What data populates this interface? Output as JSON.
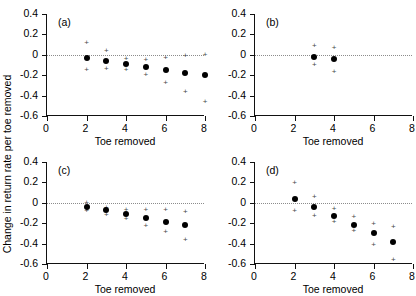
{
  "figure": {
    "ylabel": "Change in return rate per toe removed",
    "xlabel": "Toe removed"
  },
  "axis": {
    "yticks": [
      "0.4",
      "0.2",
      "0",
      "-0.2",
      "-0.4",
      "-0.6"
    ],
    "ytick_values": [
      0.4,
      0.2,
      0,
      -0.2,
      -0.4,
      -0.6
    ],
    "xticks": [
      "0",
      "2",
      "4",
      "6",
      "8"
    ],
    "xtick_values": [
      0,
      2,
      4,
      6,
      8
    ],
    "ylim": [
      -0.6,
      0.4
    ],
    "xlim": [
      0,
      8
    ]
  },
  "panels": [
    {
      "tag": "(a)"
    },
    {
      "tag": "(b)"
    },
    {
      "tag": "(c)"
    },
    {
      "tag": "(d)"
    }
  ],
  "chart_data": [
    {
      "type": "scatter",
      "panel": "(a)",
      "title": "",
      "xlabel": "Toe removed",
      "ylabel": "Change in return rate per toe removed",
      "xlim": [
        0,
        8
      ],
      "ylim": [
        -0.6,
        0.4
      ],
      "grid": false,
      "legend": "none",
      "annotations": [
        "dotted horizontal reference line at y = 0"
      ],
      "x": [
        2,
        3,
        4,
        5,
        6,
        7,
        8
      ],
      "values": [
        -0.035,
        -0.065,
        -0.09,
        -0.12,
        -0.145,
        -0.175,
        -0.2
      ],
      "upper": [
        0.125,
        0.045,
        -0.03,
        -0.045,
        -0.025,
        -0.005,
        0.005
      ],
      "lower": [
        -0.135,
        -0.125,
        -0.135,
        -0.185,
        -0.265,
        -0.355,
        -0.455
      ]
    },
    {
      "type": "scatter",
      "panel": "(b)",
      "title": "",
      "xlabel": "Toe removed",
      "ylabel": "Change in return rate per toe removed",
      "xlim": [
        0,
        8
      ],
      "ylim": [
        -0.6,
        0.4
      ],
      "grid": false,
      "legend": "none",
      "annotations": [
        "dotted horizontal reference line at y = 0"
      ],
      "x": [
        3,
        4
      ],
      "values": [
        -0.02,
        -0.045
      ],
      "upper": [
        0.1,
        0.08
      ],
      "lower": [
        -0.09,
        -0.155
      ]
    },
    {
      "type": "scatter",
      "panel": "(c)",
      "title": "",
      "xlabel": "Toe removed",
      "ylabel": "Change in return rate per toe removed",
      "xlim": [
        0,
        8
      ],
      "ylim": [
        -0.6,
        0.4
      ],
      "grid": false,
      "legend": "none",
      "annotations": [
        "dotted horizontal reference line at y = 0"
      ],
      "x": [
        2,
        3,
        4,
        5,
        6,
        7
      ],
      "values": [
        -0.04,
        -0.075,
        -0.105,
        -0.15,
        -0.185,
        -0.22
      ],
      "upper": [
        0.01,
        -0.045,
        -0.065,
        -0.065,
        -0.065,
        -0.08
      ],
      "lower": [
        -0.075,
        -0.105,
        -0.15,
        -0.215,
        -0.28,
        -0.355
      ]
    },
    {
      "type": "scatter",
      "panel": "(d)",
      "title": "",
      "xlabel": "Toe removed",
      "ylabel": "Change in return rate per toe removed",
      "xlim": [
        0,
        8
      ],
      "ylim": [
        -0.6,
        0.4
      ],
      "grid": false,
      "legend": "none",
      "annotations": [
        "dotted horizontal reference line at y = 0"
      ],
      "x": [
        2,
        3,
        4,
        5,
        6,
        7
      ],
      "values": [
        0.04,
        -0.04,
        -0.13,
        -0.22,
        -0.295,
        -0.38
      ],
      "upper": [
        0.2,
        0.065,
        -0.055,
        -0.13,
        -0.195,
        -0.23
      ],
      "lower": [
        -0.07,
        -0.115,
        -0.175,
        -0.27,
        -0.405,
        -0.55
      ]
    }
  ]
}
